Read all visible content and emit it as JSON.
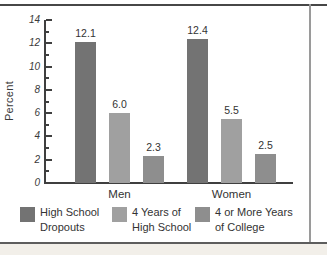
{
  "chart_data": {
    "type": "bar",
    "title": "",
    "xlabel": "",
    "ylabel": "Percent",
    "ylim": [
      0,
      14
    ],
    "yticks": [
      0,
      2,
      4,
      6,
      8,
      10,
      12,
      14
    ],
    "yticks_minor": [
      1,
      3,
      5,
      7,
      9,
      11,
      13
    ],
    "categories": [
      "Men",
      "Women"
    ],
    "series": [
      {
        "name": "High School Dropouts",
        "legend_lines": [
          "High School",
          "Dropouts"
        ],
        "color": "#737373",
        "values": [
          12.1,
          12.4
        ],
        "labels": [
          "12.1",
          "12.4"
        ]
      },
      {
        "name": "4 Years of High School",
        "legend_lines": [
          "4 Years of",
          "High School"
        ],
        "color": "#a0a0a0",
        "values": [
          6.0,
          5.5
        ],
        "labels": [
          "6.0",
          "5.5"
        ]
      },
      {
        "name": "4 or More Years of College",
        "legend_lines": [
          "4 or More Years",
          "of College"
        ],
        "color": "#8e8e8e",
        "values": [
          2.3,
          2.5
        ],
        "labels": [
          "2.3",
          "2.5"
        ]
      }
    ],
    "legend_position": "bottom",
    "grid": false,
    "axis_color": "#3f3f3f",
    "text_color": "#333333"
  }
}
